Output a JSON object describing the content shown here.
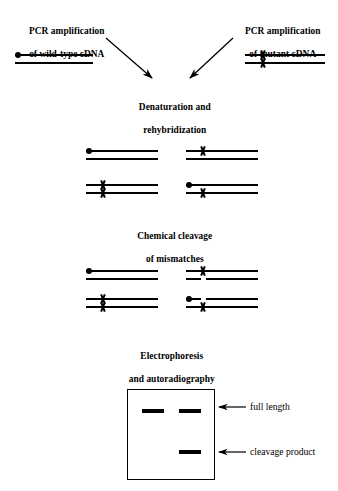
{
  "figure": {
    "ink_color": "#000000",
    "background_color": "#ffffff"
  },
  "step_labels": {
    "pcr_wildtype_line1": "PCR amplification",
    "pcr_wildtype_line2": "of wild-type cDNA",
    "pcr_mutant_line1": "PCR amplification",
    "pcr_mutant_line2": "of mutant cDNA",
    "denaturation_line1": "Denaturation and",
    "denaturation_line2": "rehybridization",
    "cleavage_line1": "Chemical cleavage",
    "cleavage_line2": "of mismatches",
    "electrophoresis_line1": "Electrophoresis",
    "electrophoresis_line2": "and autoradiography"
  },
  "gel_labels": {
    "full_length": "full length",
    "cleavage_product": "cleavage product"
  },
  "icons": {
    "radiolabel": "filled-dot-icon",
    "mismatch": "x-mismatch-icon",
    "arrow": "arrow-icon"
  },
  "panels": {
    "inputs": {
      "wildtype": {
        "name": "wild-type duplex",
        "has_radiolabel": true,
        "mismatches_top": 0,
        "mismatches_bottom": 0
      },
      "mutant": {
        "name": "mutant duplex",
        "has_radiolabel": false,
        "mismatches_top": 1,
        "mismatches_bottom": 1
      }
    },
    "rehybridized": [
      {
        "name": "wild-type homoduplex",
        "position": "top-left",
        "radiolabel": true,
        "top_x": false,
        "bottom_x": false,
        "cleaved_top": false,
        "cleaved_bottom": false
      },
      {
        "name": "heteroduplex-a",
        "position": "top-right",
        "radiolabel": false,
        "top_x": true,
        "bottom_x": false,
        "cleaved_top": false,
        "cleaved_bottom": true
      },
      {
        "name": "mutant homoduplex",
        "position": "bottom-left",
        "radiolabel": false,
        "top_x": true,
        "bottom_x": true,
        "cleaved_top": false,
        "cleaved_bottom": false
      },
      {
        "name": "heteroduplex-b",
        "position": "bottom-right",
        "radiolabel": true,
        "top_x": false,
        "bottom_x": true,
        "cleaved_top": true,
        "cleaved_bottom": false
      }
    ],
    "gel": {
      "lanes": 2,
      "lane1_bands": [
        "full length"
      ],
      "lane2_bands": [
        "full length",
        "cleavage product"
      ]
    }
  }
}
